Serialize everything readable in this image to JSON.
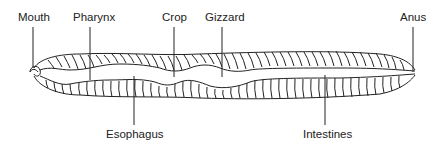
{
  "diagram": {
    "labels": {
      "top": [
        {
          "text": "Mouth",
          "x": 18,
          "line_x": 33
        },
        {
          "text": "Pharynx",
          "x": 73,
          "line_x": 90
        },
        {
          "text": "Crop",
          "x": 162,
          "line_x": 174
        },
        {
          "text": "Gizzard",
          "x": 205,
          "line_x": 222
        },
        {
          "text": "Anus",
          "x": 400,
          "line_x": 413
        }
      ],
      "bottom": [
        {
          "text": "Esophagus",
          "x": 106,
          "line_x": 134
        },
        {
          "text": "Intestines",
          "x": 303,
          "line_x": 325
        }
      ]
    },
    "colors": {
      "line": "#222222",
      "background": "#ffffff"
    }
  }
}
